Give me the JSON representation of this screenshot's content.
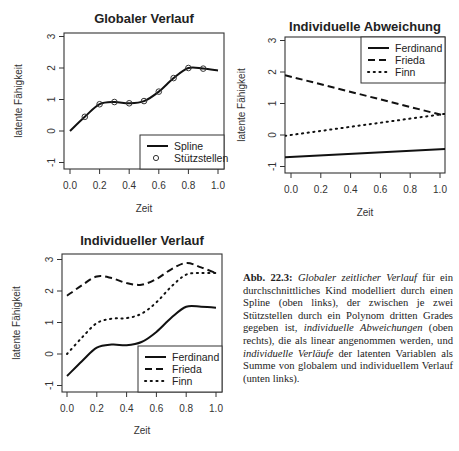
{
  "chart_data": [
    {
      "type": "line",
      "title": "Globaler Verlauf",
      "xlabel": "Zeit",
      "ylabel": "latente Fähigkeit",
      "xlim": [
        0,
        1
      ],
      "ylim": [
        -1.2,
        3.3
      ],
      "xticks": [
        "0.0",
        "0.2",
        "0.4",
        "0.6",
        "0.8",
        "1.0"
      ],
      "yticks": [
        "-1",
        "0",
        "1",
        "2",
        "3"
      ],
      "x": [
        0.0,
        0.1,
        0.2,
        0.3,
        0.4,
        0.5,
        0.6,
        0.7,
        0.8,
        0.9,
        1.0
      ],
      "series": [
        {
          "name": "Spline",
          "style": "solid",
          "values": [
            0.0,
            0.45,
            0.85,
            0.92,
            0.88,
            0.95,
            1.25,
            1.68,
            2.0,
            1.98,
            1.92
          ]
        },
        {
          "name": "Stützstellen",
          "style": "points",
          "x": [
            0.1,
            0.2,
            0.3,
            0.4,
            0.5,
            0.6,
            0.7,
            0.8,
            0.9
          ],
          "values": [
            0.45,
            0.85,
            0.92,
            0.88,
            0.95,
            1.25,
            1.68,
            2.0,
            1.98
          ]
        }
      ],
      "legend": {
        "position": "bottomright",
        "entries": [
          "Spline",
          "Stützstellen"
        ]
      }
    },
    {
      "type": "line",
      "title": "Individuelle Abweichung",
      "xlabel": "Zeit",
      "ylabel": "latente Fähigkeit",
      "xlim": [
        0,
        1
      ],
      "ylim": [
        -1.2,
        3.3
      ],
      "xticks": [
        "0.0",
        "0.2",
        "0.4",
        "0.6",
        "0.8",
        "1.0"
      ],
      "yticks": [
        "-1",
        "0",
        "1",
        "2",
        "3"
      ],
      "x": [
        0.0,
        1.0
      ],
      "series": [
        {
          "name": "Ferdinand",
          "style": "solid",
          "values": [
            -0.7,
            -0.45
          ]
        },
        {
          "name": "Frieda",
          "style": "dashed",
          "values": [
            1.85,
            0.65
          ]
        },
        {
          "name": "Finn",
          "style": "dotted",
          "values": [
            0.0,
            0.65
          ]
        }
      ],
      "legend": {
        "position": "topright",
        "entries": [
          "Ferdinand",
          "Frieda",
          "Finn"
        ]
      }
    },
    {
      "type": "line",
      "title": "Individueller Verlauf",
      "xlabel": "Zeit",
      "ylabel": "latente Fähigkeit",
      "xlim": [
        0,
        1
      ],
      "ylim": [
        -1.2,
        3.3
      ],
      "xticks": [
        "0.0",
        "0.2",
        "0.4",
        "0.6",
        "0.8",
        "1.0"
      ],
      "yticks": [
        "-1",
        "0",
        "1",
        "2",
        "3"
      ],
      "x": [
        0.0,
        0.1,
        0.2,
        0.3,
        0.4,
        0.5,
        0.6,
        0.7,
        0.8,
        0.9,
        1.0
      ],
      "series": [
        {
          "name": "Ferdinand",
          "style": "solid",
          "values": [
            -0.7,
            -0.23,
            0.2,
            0.3,
            0.28,
            0.38,
            0.7,
            1.15,
            1.5,
            1.5,
            1.47
          ]
        },
        {
          "name": "Frieda",
          "style": "dashed",
          "values": [
            1.85,
            2.18,
            2.46,
            2.41,
            2.25,
            2.2,
            2.38,
            2.69,
            2.89,
            2.75,
            2.57
          ]
        },
        {
          "name": "Finn",
          "style": "dotted",
          "values": [
            0.0,
            0.52,
            0.98,
            1.12,
            1.14,
            1.28,
            1.64,
            2.14,
            2.52,
            2.57,
            2.57
          ]
        }
      ],
      "legend": {
        "position": "bottomright",
        "entries": [
          "Ferdinand",
          "Frieda",
          "Finn"
        ]
      }
    }
  ],
  "plots": [
    {
      "title": "Globaler Verlauf",
      "xlabel": "Zeit",
      "ylabel": "latente Fähigkeit",
      "legend": [
        "Spline",
        "Stützstellen"
      ]
    },
    {
      "title": "Individuelle Abweichung",
      "xlabel": "Zeit",
      "ylabel": "latente Fähigkeit",
      "legend": [
        "Ferdinand",
        "Frieda",
        "Finn"
      ]
    },
    {
      "title": "Individueller Verlauf",
      "xlabel": "Zeit",
      "ylabel": "latente Fähigkeit",
      "legend": [
        "Ferdinand",
        "Frieda",
        "Finn"
      ]
    }
  ],
  "ticks": {
    "x": [
      "0.0",
      "0.2",
      "0.4",
      "0.6",
      "0.8",
      "1.0"
    ],
    "y": [
      "-1",
      "0",
      "1",
      "2",
      "3"
    ]
  },
  "caption": {
    "label": "Abb. 22.3:",
    "parts": [
      {
        "text": "Globaler zeitlicher Verlauf",
        "italic": true
      },
      {
        "text": " für ein durchschnittliches Kind modelliert durch einen Spline (oben links), der zwischen je zwei Stützstellen durch ein Polynom dritten Grades gegeben ist, ",
        "italic": false
      },
      {
        "text": "individuelle Abweichungen",
        "italic": true
      },
      {
        "text": " (oben rechts), die als linear angenommen werden, und ",
        "italic": false
      },
      {
        "text": "individuelle Verläufe",
        "italic": true
      },
      {
        "text": " der latenten Variablen als Summe von globalem und individuellem Verlauf (unten links).",
        "italic": false
      }
    ]
  }
}
